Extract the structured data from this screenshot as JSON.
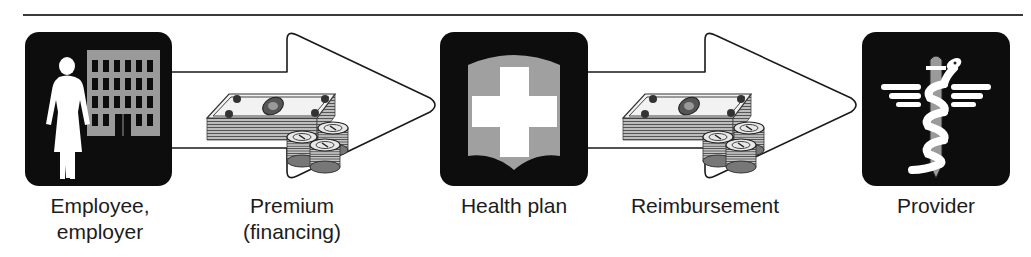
{
  "diagram": {
    "nodes": [
      {
        "id": "employee",
        "label_line1": "Employee,",
        "label_line2": "employer",
        "icon": "person-building-icon"
      },
      {
        "id": "health_plan",
        "label_line1": "Health plan",
        "icon": "shield-cross-icon"
      },
      {
        "id": "provider",
        "label_line1": "Provider",
        "icon": "caduceus-icon"
      }
    ],
    "edges": [
      {
        "from": "employee",
        "to": "health_plan",
        "label_line1": "Premium",
        "label_line2": "(financing)",
        "icon": "money-stack-icon"
      },
      {
        "from": "health_plan",
        "to": "provider",
        "label_line1": "Reimbursement",
        "icon": "money-stack-icon"
      }
    ],
    "colors": {
      "box_fill": "#0d0d0d",
      "icon_gray": "#9a9a9a",
      "icon_white": "#ffffff",
      "arrow_stroke": "#1a1a1a",
      "rule": "#3a3a3a"
    }
  }
}
